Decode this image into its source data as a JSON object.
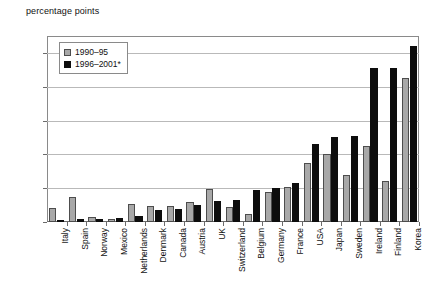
{
  "chart_data": {
    "type": "bar",
    "title": "percentage points",
    "xlabel": "",
    "ylabel": "percentage points",
    "ylim": [
      0.0,
      1.1
    ],
    "yticks": [
      "0.00",
      "0.20",
      "0.40",
      "0.60",
      "0.80",
      "1.00"
    ],
    "ytick_values": [
      0.0,
      0.2,
      0.4,
      0.6,
      0.8,
      1.0
    ],
    "grid": true,
    "legend_position": "top-left",
    "categories": [
      "Italy",
      "Spain",
      "Norway",
      "Mexico",
      "Netherlands",
      "Denmark",
      "Canada",
      "Austria",
      "UK",
      "Switzerland",
      "Belgium",
      "Germany",
      "France",
      "USA",
      "Japan",
      "Sweden",
      "Ireland",
      "Finland",
      "Korea"
    ],
    "series": [
      {
        "name": "1990–95",
        "color": "#a8a8a8",
        "values": [
          0.08,
          0.145,
          0.03,
          0.015,
          0.105,
          0.095,
          0.095,
          0.12,
          0.195,
          0.09,
          0.045,
          0.18,
          0.21,
          0.35,
          0.4,
          0.28,
          0.45,
          0.24,
          0.85
        ]
      },
      {
        "name": "1996–2001*",
        "color": "#0d0d0d",
        "values": [
          0.01,
          0.02,
          0.015,
          0.025,
          0.035,
          0.07,
          0.075,
          0.1,
          0.125,
          0.13,
          0.19,
          0.2,
          0.23,
          0.46,
          0.5,
          0.51,
          0.91,
          0.91,
          1.04
        ]
      }
    ]
  },
  "legend": {
    "items": [
      {
        "label": "1990–95"
      },
      {
        "label": "1996–2001*"
      }
    ]
  }
}
